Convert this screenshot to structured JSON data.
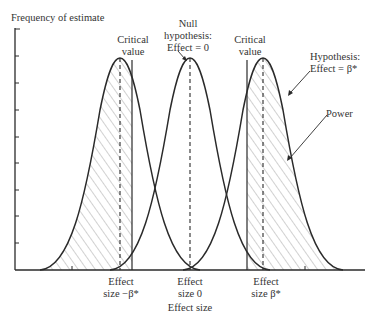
{
  "diagram": {
    "y_axis_label": "Frequency of estimate",
    "x_axis_label": "Effect size",
    "annotations": {
      "critical_value_left": [
        "Critical",
        "value"
      ],
      "null_hypothesis": [
        "Null",
        "hypothesis:",
        "Effect = 0"
      ],
      "critical_value_right": [
        "Critical",
        "value"
      ],
      "hypothesis": [
        "Hypothesis:",
        "Effect = β*"
      ],
      "power": "Power"
    },
    "x_ticks": [
      {
        "line1": "Effect",
        "line2": "size −β*"
      },
      {
        "line1": "Effect",
        "line2": "size 0"
      },
      {
        "line1": "Effect",
        "line2": "size β*"
      }
    ],
    "curves": [
      {
        "name": "Hypothesis: Effect = −β*",
        "center": "−β*",
        "shaded": "left of critical value"
      },
      {
        "name": "Null hypothesis: Effect = 0",
        "center": "0",
        "shaded": "none"
      },
      {
        "name": "Hypothesis: Effect = β*",
        "center": "β*",
        "shaded": "right of critical value (Power)"
      }
    ],
    "colors": {
      "line": "#2a2a2a",
      "hatch": "#9a9a9a",
      "background": "#ffffff"
    }
  }
}
